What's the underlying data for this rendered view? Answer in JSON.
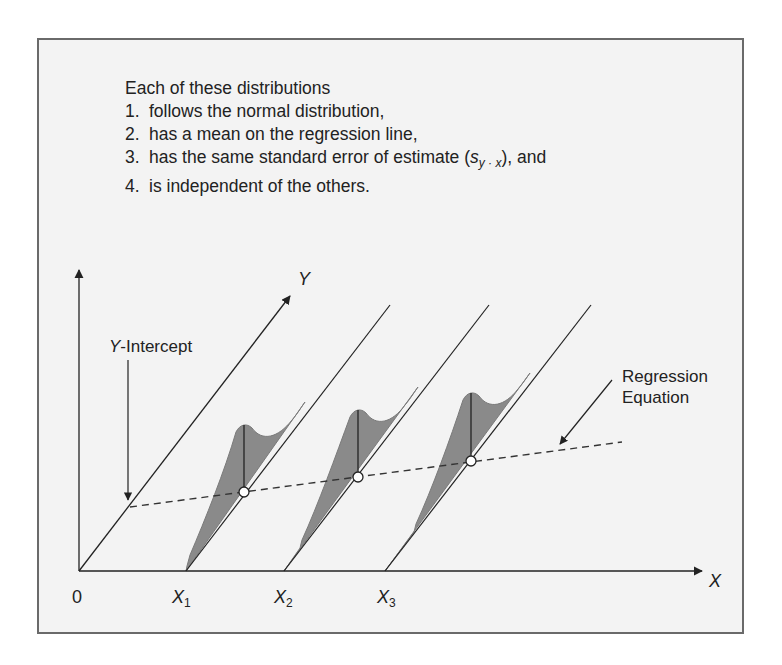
{
  "caption": {
    "intro": "Each of these distributions",
    "items": [
      {
        "num": "1.",
        "text": "follows the normal distribution,"
      },
      {
        "num": "2.",
        "text": "has a mean on the regression line,"
      },
      {
        "num": "3.",
        "text_before": "has the same standard error of estimate (",
        "symbol_main": "s",
        "symbol_sub": "y · x",
        "text_after": "), and"
      },
      {
        "num": "4.",
        "text": "is independent of the others."
      }
    ]
  },
  "labels": {
    "y_axis_diagonal": "Y",
    "x_axis": "X",
    "origin": "0",
    "y_intercept": "-Intercept",
    "y_intercept_italic": "Y",
    "regression_line1": "Regression",
    "regression_line2": "Equation",
    "x_ticks": [
      {
        "main": "X",
        "sub": "1"
      },
      {
        "main": "X",
        "sub": "2"
      },
      {
        "main": "X",
        "sub": "3"
      }
    ]
  },
  "colors": {
    "background": "#f3f3f3",
    "frame": "#6a6a6a",
    "distribution_fill": "#8a8a8a",
    "line": "#222222"
  }
}
